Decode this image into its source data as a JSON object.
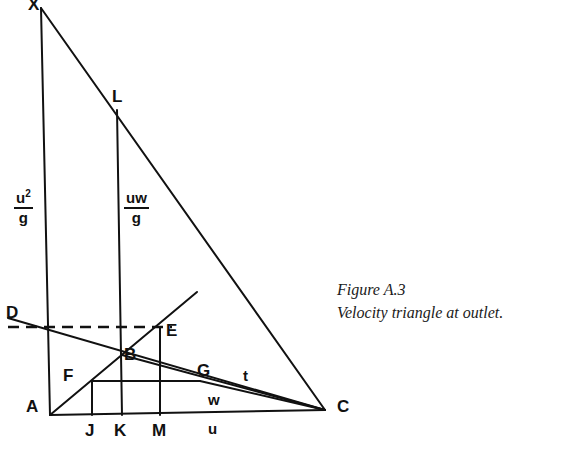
{
  "figure": {
    "caption_line1": "Figure A.3",
    "caption_line2": "Velocity triangle at outlet.",
    "caption_x": 337,
    "caption_y": 278
  },
  "ink_color": "#111111",
  "vertices": [
    {
      "label": "X",
      "x": 28,
      "y": -4,
      "point_x": 41,
      "point_y": 8
    },
    {
      "label": "L",
      "x": 112,
      "y": 88,
      "point_x": 117,
      "point_y": 110
    },
    {
      "label": "D",
      "x": 6,
      "y": 304,
      "point_x": 8,
      "point_y": 318
    },
    {
      "label": "E",
      "x": 166,
      "y": 322,
      "point_x": 172,
      "point_y": 327
    },
    {
      "label": "B",
      "x": 124,
      "y": 346,
      "point_x": 122,
      "point_y": 355
    },
    {
      "label": "F",
      "x": 63,
      "y": 367,
      "point_x": 92,
      "point_y": 381
    },
    {
      "label": "G",
      "x": 197,
      "y": 362,
      "point_x": 200,
      "point_y": 381
    },
    {
      "label": "A",
      "x": 26,
      "y": 398,
      "point_x": 50,
      "point_y": 415
    },
    {
      "label": "C",
      "x": 337,
      "y": 398,
      "point_x": 325,
      "point_y": 410
    },
    {
      "label": "J",
      "x": 85,
      "y": 422,
      "point_x": 92,
      "point_y": 415
    },
    {
      "label": "K",
      "x": 114,
      "y": 422,
      "point_x": 122,
      "point_y": 415
    },
    {
      "label": "M",
      "x": 152,
      "y": 422,
      "point_x": 160,
      "point_y": 415
    }
  ],
  "quantity_labels": [
    {
      "label": "t",
      "x": 243,
      "y": 368
    },
    {
      "label": "w",
      "x": 208,
      "y": 392
    },
    {
      "label": "u",
      "x": 208,
      "y": 421
    }
  ],
  "fractions": [
    {
      "numerator": "u",
      "exponent": "2",
      "denominator": "g",
      "x": 14,
      "y": 190
    },
    {
      "numerator": "uw",
      "exponent": "",
      "denominator": "g",
      "x": 124,
      "y": 190
    }
  ],
  "chart_data": {
    "type": "diagram",
    "title": "Velocity triangle at outlet",
    "solid_segments": [
      {
        "name": "left-vertical-XA",
        "from": [
          41,
          8
        ],
        "to": [
          50,
          415
        ]
      },
      {
        "name": "hypotenuse-XC",
        "from": [
          41,
          8
        ],
        "to": [
          325,
          410
        ]
      },
      {
        "name": "base-AC",
        "from": [
          50,
          415
        ],
        "to": [
          325,
          410
        ]
      },
      {
        "name": "vertical-LK",
        "from": [
          117,
          110
        ],
        "to": [
          122,
          415
        ]
      },
      {
        "name": "ray-A-through-B",
        "from": [
          50,
          415
        ],
        "to": [
          197,
          292
        ]
      },
      {
        "name": "line-D-to-C",
        "from": [
          8,
          318
        ],
        "to": [
          325,
          410
        ]
      },
      {
        "name": "horizontal-FG",
        "from": [
          92,
          381
        ],
        "to": [
          200,
          381
        ]
      },
      {
        "name": "vertical-J",
        "from": [
          92,
          381
        ],
        "to": [
          92,
          415
        ]
      },
      {
        "name": "vertical-M",
        "from": [
          160,
          327
        ],
        "to": [
          160,
          415
        ]
      },
      {
        "name": "segment-B-to-C",
        "from": [
          122,
          355
        ],
        "to": [
          325,
          410
        ]
      },
      {
        "name": "segment-G-to-C",
        "from": [
          200,
          381
        ],
        "to": [
          325,
          410
        ]
      }
    ],
    "dashed_segments": [
      {
        "name": "dashed-D-to-E",
        "from": [
          8,
          327
        ],
        "to": [
          172,
          327
        ]
      }
    ]
  }
}
